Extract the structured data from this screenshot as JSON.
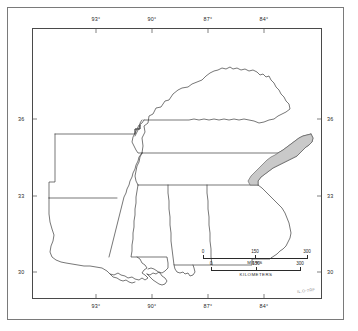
{
  "figure": {
    "kind": "reference-map",
    "region": "Southeastern United States",
    "corner_id": "IL.O-7RF"
  },
  "graticule": {
    "longitude_labels": [
      "93°",
      "90°",
      "87°",
      "84°"
    ],
    "longitude_x": [
      96,
      152,
      208,
      264
    ],
    "latitude_labels": [
      "36",
      "33",
      "30"
    ],
    "latitude_y": [
      119,
      196,
      272
    ]
  },
  "scale_bars": [
    {
      "unit": "MILES",
      "ticks": [
        "0",
        "150",
        "300"
      ],
      "min": 0,
      "max": 300
    },
    {
      "unit": "KILOMETERS",
      "ticks": [
        "0",
        "150",
        "300"
      ],
      "min": 0,
      "max": 300
    }
  ],
  "shaded_area": {
    "label": "study-area",
    "fill": "#c9c9c9",
    "stroke": "#555555",
    "description": "Shaded band along eastern Tennessee and western North Carolina"
  },
  "colors": {
    "state_outline": "#3c3c3c",
    "neatline": "#4a4a4a",
    "outer_border": "#7a7a7a",
    "background": "#ffffff",
    "shade": "#c9c9c9"
  }
}
